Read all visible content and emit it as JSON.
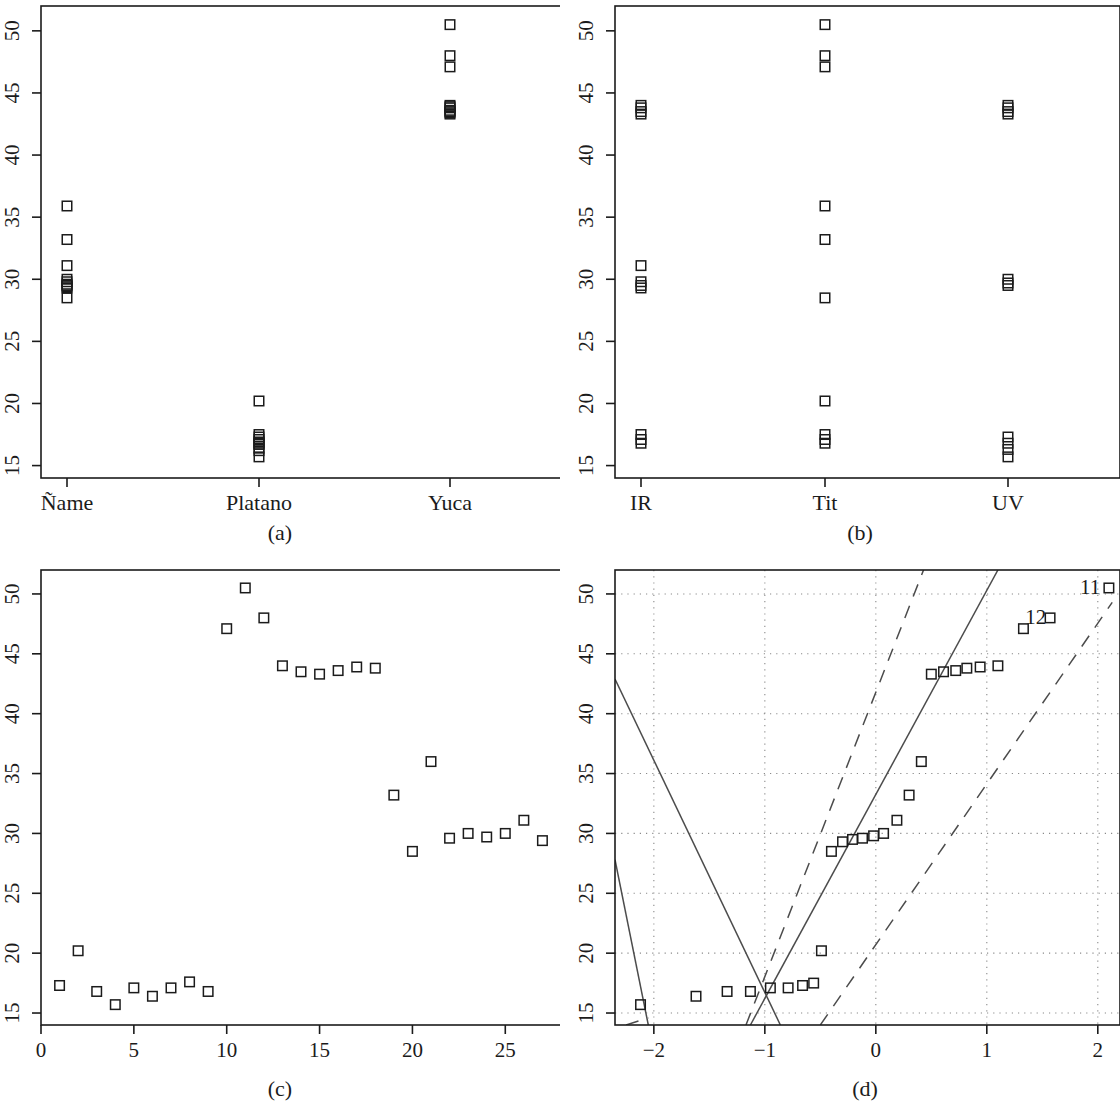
{
  "figure": {
    "background": "#ffffff",
    "ink": "#1b1b1b",
    "grid_color": "#8a8a8a",
    "marker": "open-square",
    "panels_count": 4
  },
  "captions": {
    "a": "(a)",
    "b": "(b)",
    "c": "(c)",
    "d": "(d)"
  },
  "chart_data": [
    {
      "id": "a",
      "type": "scatter",
      "title": "",
      "caption": "(a)",
      "xlabel": "",
      "ylabel": "",
      "x_type": "categorical",
      "categories": [
        "Ñame",
        "Platano",
        "Yuca"
      ],
      "ylim": [
        14,
        52
      ],
      "yticks": [
        15,
        20,
        25,
        30,
        35,
        40,
        45,
        50
      ],
      "ytick_labels": [
        "15",
        "20",
        "25",
        "30",
        "35",
        "40",
        "45",
        "50"
      ],
      "grid": false,
      "box": true,
      "series": [
        {
          "name": "Ñame",
          "category_index": 0,
          "values": [
            35.9,
            33.2,
            31.1,
            30.0,
            29.8,
            29.6,
            29.5,
            29.4,
            29.3,
            28.5
          ]
        },
        {
          "name": "Platano",
          "category_index": 1,
          "values": [
            20.2,
            17.5,
            17.3,
            17.1,
            16.9,
            16.8,
            16.7,
            16.4,
            16.2,
            15.7
          ]
        },
        {
          "name": "Yuca",
          "category_index": 2,
          "values": [
            50.5,
            48.0,
            47.1,
            44.0,
            43.9,
            43.8,
            43.6,
            43.5,
            43.4,
            43.3
          ]
        }
      ]
    },
    {
      "id": "b",
      "type": "scatter",
      "title": "",
      "caption": "(b)",
      "xlabel": "",
      "ylabel": "",
      "x_type": "categorical",
      "categories": [
        "IR",
        "Tit",
        "UV"
      ],
      "ylim": [
        14,
        52
      ],
      "yticks": [
        15,
        20,
        25,
        30,
        35,
        40,
        45,
        50
      ],
      "ytick_labels": [
        "15",
        "20",
        "25",
        "30",
        "35",
        "40",
        "45",
        "50"
      ],
      "grid": false,
      "box": true,
      "series": [
        {
          "name": "IR",
          "category_index": 0,
          "values": [
            44.0,
            43.8,
            43.5,
            43.3,
            31.1,
            29.8,
            29.5,
            29.3,
            17.5,
            17.1,
            16.8
          ]
        },
        {
          "name": "Tit",
          "category_index": 1,
          "values": [
            50.5,
            48.0,
            47.1,
            35.9,
            33.2,
            28.5,
            20.2,
            17.5,
            17.1,
            16.8
          ]
        },
        {
          "name": "UV",
          "category_index": 2,
          "values": [
            44.0,
            43.8,
            43.5,
            43.3,
            30.0,
            29.7,
            29.5,
            17.3,
            16.8,
            16.3,
            15.7
          ]
        }
      ]
    },
    {
      "id": "c",
      "type": "scatter",
      "title": "",
      "caption": "(c)",
      "xlabel": "",
      "ylabel": "",
      "xlim": [
        0,
        28
      ],
      "ylim": [
        14,
        52
      ],
      "xticks": [
        0,
        5,
        10,
        15,
        20,
        25
      ],
      "xtick_labels": [
        "0",
        "5",
        "10",
        "15",
        "20",
        "25"
      ],
      "yticks": [
        15,
        20,
        25,
        30,
        35,
        40,
        45,
        50
      ],
      "ytick_labels": [
        "15",
        "20",
        "25",
        "30",
        "35",
        "40",
        "45",
        "50"
      ],
      "grid": false,
      "box": true,
      "x": [
        1,
        2,
        3,
        4,
        5,
        6,
        7,
        8,
        9,
        10,
        11,
        12,
        13,
        14,
        15,
        16,
        17,
        18,
        19,
        20,
        21,
        22,
        23,
        24,
        25,
        26,
        27
      ],
      "values": [
        17.3,
        20.2,
        16.8,
        15.7,
        17.1,
        16.4,
        17.1,
        17.6,
        16.8,
        47.1,
        50.5,
        48.0,
        44.0,
        43.5,
        43.3,
        43.6,
        43.9,
        43.8,
        33.2,
        28.5,
        36.0,
        29.6,
        30.0,
        29.7,
        30.0,
        31.1,
        29.4
      ]
    },
    {
      "id": "d",
      "type": "scatter",
      "title": "",
      "caption": "(d)",
      "xlabel": "",
      "ylabel": "",
      "xlim": [
        -2.35,
        2.2
      ],
      "ylim": [
        14,
        52
      ],
      "xticks": [
        -2,
        -1,
        0,
        1,
        2
      ],
      "xtick_labels": [
        "−2",
        "−1",
        "0",
        "1",
        "2"
      ],
      "yticks": [
        15,
        20,
        25,
        30,
        35,
        40,
        45,
        50
      ],
      "ytick_labels": [
        "15",
        "20",
        "25",
        "30",
        "35",
        "40",
        "45",
        "50"
      ],
      "grid": true,
      "grid_style": "dotted",
      "box": true,
      "points": [
        {
          "x": -2.12,
          "y": 15.7,
          "label": ""
        },
        {
          "x": -1.62,
          "y": 16.4,
          "label": ""
        },
        {
          "x": -1.34,
          "y": 16.8,
          "label": ""
        },
        {
          "x": -1.13,
          "y": 16.8,
          "label": ""
        },
        {
          "x": -0.95,
          "y": 17.1,
          "label": ""
        },
        {
          "x": -0.79,
          "y": 17.1,
          "label": ""
        },
        {
          "x": -0.66,
          "y": 17.3,
          "label": ""
        },
        {
          "x": -0.56,
          "y": 17.5,
          "label": ""
        },
        {
          "x": -0.49,
          "y": 20.2,
          "label": ""
        },
        {
          "x": -0.4,
          "y": 28.5,
          "label": ""
        },
        {
          "x": -0.3,
          "y": 29.3,
          "label": ""
        },
        {
          "x": -0.21,
          "y": 29.5,
          "label": ""
        },
        {
          "x": -0.12,
          "y": 29.6,
          "label": ""
        },
        {
          "x": -0.02,
          "y": 29.8,
          "label": ""
        },
        {
          "x": 0.07,
          "y": 30.0,
          "label": ""
        },
        {
          "x": 0.19,
          "y": 31.1,
          "label": ""
        },
        {
          "x": 0.3,
          "y": 33.2,
          "label": ""
        },
        {
          "x": 0.41,
          "y": 36.0,
          "label": ""
        },
        {
          "x": 0.5,
          "y": 43.3,
          "label": ""
        },
        {
          "x": 0.61,
          "y": 43.5,
          "label": ""
        },
        {
          "x": 0.72,
          "y": 43.6,
          "label": ""
        },
        {
          "x": 0.82,
          "y": 43.8,
          "label": ""
        },
        {
          "x": 0.94,
          "y": 43.9,
          "label": ""
        },
        {
          "x": 1.1,
          "y": 44.0,
          "label": ""
        },
        {
          "x": 1.33,
          "y": 47.1,
          "label": "12"
        },
        {
          "x": 1.57,
          "y": 48.0,
          "label": "12"
        },
        {
          "x": 2.1,
          "y": 50.5,
          "label": "11"
        }
      ],
      "annotations": [
        {
          "text": "11",
          "x": 1.93,
          "y": 50.6
        },
        {
          "text": "12",
          "x": 1.44,
          "y": 48.1
        }
      ],
      "reference_lines": [
        {
          "style": "solid",
          "name": "qq-line-main",
          "x1": -1.13,
          "y1": 14.0,
          "x2": 1.1,
          "y2": 52.0
        },
        {
          "style": "solid",
          "name": "qq-line-mirror",
          "x1": -2.35,
          "y1": 42.9,
          "x2": -0.86,
          "y2": 14.0
        },
        {
          "style": "solid",
          "name": "qq-line-left-edge",
          "x1": -2.35,
          "y1": 27.8,
          "x2": -2.05,
          "y2": 14.0
        },
        {
          "style": "dashed",
          "name": "qq-band-upper",
          "x1": -1.17,
          "y1": 14.0,
          "x2": 0.43,
          "y2": 52.0
        },
        {
          "style": "dashed",
          "name": "qq-band-lower",
          "x1": -0.5,
          "y1": 14.0,
          "x2": 2.13,
          "y2": 49.3
        },
        {
          "style": "dashed",
          "name": "qq-band-lower-left",
          "x1": -2.25,
          "y1": 14.0,
          "x2": -2.05,
          "y2": 14.6
        }
      ]
    }
  ]
}
